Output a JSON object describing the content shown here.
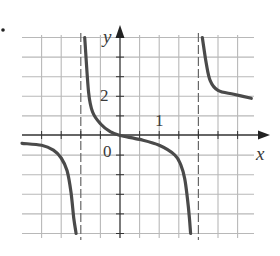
{
  "problem_marker": "•",
  "chart_data": {
    "type": "line",
    "title": "",
    "xlabel": "x",
    "ylabel": "y",
    "x_tick_labels": [
      {
        "value": 1,
        "label": "1"
      }
    ],
    "y_tick_labels": [
      {
        "value": 2,
        "label": "2"
      }
    ],
    "origin_label": "0",
    "grid": true,
    "grid_units": {
      "x_per_cell": 0.5,
      "y_per_cell": 1
    },
    "xlim": [
      -2.5,
      3.5
    ],
    "ylim": [
      -5,
      5
    ],
    "vertical_asymptotes": [
      -1,
      2
    ],
    "series": [
      {
        "name": "left-branch",
        "points": [
          [
            -2.5,
            -0.4
          ],
          [
            -2.0,
            -0.5
          ],
          [
            -1.7,
            -0.75
          ],
          [
            -1.5,
            -1.15
          ],
          [
            -1.35,
            -1.8
          ],
          [
            -1.25,
            -2.9
          ],
          [
            -1.18,
            -4.2
          ],
          [
            -1.12,
            -5.0
          ]
        ]
      },
      {
        "name": "middle-branch",
        "points": [
          [
            -0.9,
            5.0
          ],
          [
            -0.8,
            2.2
          ],
          [
            -0.7,
            1.2
          ],
          [
            -0.5,
            0.6
          ],
          [
            -0.25,
            0.2
          ],
          [
            0,
            0
          ],
          [
            0.5,
            -0.2
          ],
          [
            1.0,
            -0.5
          ],
          [
            1.4,
            -1.0
          ],
          [
            1.55,
            -1.5
          ],
          [
            1.65,
            -2.2
          ],
          [
            1.72,
            -3.2
          ],
          [
            1.77,
            -4.2
          ],
          [
            1.8,
            -5.0
          ]
        ]
      },
      {
        "name": "right-branch",
        "points": [
          [
            2.1,
            5.0
          ],
          [
            2.2,
            3.7
          ],
          [
            2.3,
            2.8
          ],
          [
            2.5,
            2.3
          ],
          [
            2.9,
            2.1
          ],
          [
            3.35,
            1.9
          ]
        ]
      }
    ]
  },
  "colors": {
    "curve": "#4a4a4a",
    "grid": "#b8b8b8",
    "axis": "#333333",
    "asymptote": "#666666"
  }
}
